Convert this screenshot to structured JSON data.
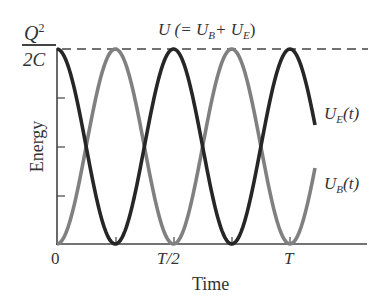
{
  "chart_data": {
    "type": "line",
    "xlabel": "Time",
    "ylabel": "Energy",
    "x_ticks": [
      "0",
      "T/2",
      "T"
    ],
    "y_top_label": {
      "numerator": "Q²",
      "denominator": "2C"
    },
    "y_range": [
      0,
      "Q²/2C"
    ],
    "x_range_periods": [
      0,
      1.1
    ],
    "grid": false,
    "legend": "inline labels at right",
    "series": [
      {
        "name": "U_E(t)",
        "label": "U_E(t)",
        "formula": "(Q²/2C)·cos²(2πt/T)",
        "color": "#2b2b2b",
        "x": [
          0,
          0.125,
          0.25,
          0.375,
          0.5,
          0.625,
          0.75,
          0.875,
          1.0,
          1.1
        ],
        "values_fraction": [
          1,
          0.5,
          0,
          0.5,
          1,
          0.5,
          0,
          0.5,
          1,
          0.65
        ]
      },
      {
        "name": "U_B(t)",
        "label": "U_B(t)",
        "formula": "(Q²/2C)·sin²(2πt/T)",
        "color": "#7a7a7a",
        "x": [
          0,
          0.125,
          0.25,
          0.375,
          0.5,
          0.625,
          0.75,
          0.875,
          1.0,
          1.1
        ],
        "values_fraction": [
          0,
          0.5,
          1,
          0.5,
          0,
          0.5,
          1,
          0.5,
          0,
          0.35
        ]
      },
      {
        "name": "U",
        "label": "U (= U_B + U_E)",
        "style": "dashed",
        "constant": "Q²/2C",
        "values_fraction": [
          1,
          1
        ]
      }
    ]
  },
  "labels": {
    "total": {
      "prefix": "U (= U",
      "sub1": "B",
      "mid": "+ U",
      "sub2": "E",
      "suffix": ")"
    },
    "ue": {
      "main": "U",
      "sub": "E",
      "arg": "(t)"
    },
    "ub": {
      "main": "U",
      "sub": "B",
      "arg": "(t)"
    },
    "q_num": "Q",
    "q_exp": "2",
    "q_den": "2C",
    "x0": "0",
    "xhalf": "T/2",
    "xT": "T",
    "xlabel": "Time",
    "ylabel": "Energy"
  },
  "colors": {
    "ue": "#262626",
    "ub": "#808080",
    "axis": "#444444"
  }
}
